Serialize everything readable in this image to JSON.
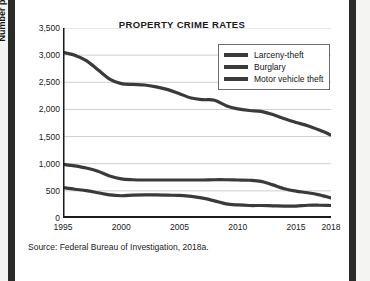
{
  "figure": {
    "title": "PROPERTY CRIME RATES",
    "source_note": "Source:  Federal Bureau of Investigation, 2018a."
  },
  "chart_data": {
    "type": "line",
    "title": "PROPERTY CRIME RATES",
    "xlabel": "",
    "ylabel": "Number per 100,000 people",
    "xlim": [
      1995,
      2018
    ],
    "ylim": [
      0,
      3500
    ],
    "ytick_labels": [
      "3,500",
      "3,000",
      "2,500",
      "2,000",
      "1,500",
      "1,000",
      "500",
      "0"
    ],
    "yticks": [
      3500,
      3000,
      2500,
      2000,
      1500,
      1000,
      500,
      0
    ],
    "xtick_labels": [
      "1995",
      "2000",
      "2005",
      "2010",
      "2015",
      "2018"
    ],
    "xticks": [
      1995,
      2000,
      2005,
      2010,
      2015,
      2018
    ],
    "grid": "horizontal",
    "legend_position": "top-right",
    "x": [
      1995,
      1996,
      1997,
      1998,
      1999,
      2000,
      2001,
      2002,
      2003,
      2004,
      2005,
      2006,
      2007,
      2008,
      2009,
      2010,
      2011,
      2012,
      2013,
      2014,
      2015,
      2016,
      2017,
      2018
    ],
    "series": [
      {
        "name": "Larceny-theft",
        "color": "#3a3a3a",
        "values": [
          3050,
          3000,
          2900,
          2730,
          2560,
          2475,
          2460,
          2450,
          2415,
          2365,
          2290,
          2210,
          2180,
          2170,
          2070,
          2010,
          1980,
          1965,
          1905,
          1830,
          1760,
          1700,
          1620,
          1530
        ]
      },
      {
        "name": "Burglary",
        "color": "#3a3a3a",
        "values": [
          990,
          960,
          920,
          860,
          775,
          720,
          705,
          700,
          700,
          700,
          700,
          700,
          700,
          705,
          705,
          700,
          695,
          675,
          610,
          540,
          495,
          465,
          425,
          370
        ]
      },
      {
        "name": "Motor vehicle theft",
        "color": "#3a3a3a",
        "values": [
          560,
          530,
          505,
          465,
          425,
          410,
          420,
          425,
          425,
          420,
          415,
          400,
          365,
          315,
          260,
          240,
          230,
          230,
          225,
          220,
          220,
          235,
          235,
          230
        ]
      }
    ]
  },
  "legend": {
    "items": [
      {
        "label": "Larceny-theft"
      },
      {
        "label": "Burglary"
      },
      {
        "label": "Motor vehicle theft"
      }
    ]
  },
  "colors": {
    "line": "#3a3a3a",
    "axis": "#1a1a1a",
    "grid": "#cfcfcf",
    "scan_bar": "#2b2b2b"
  }
}
